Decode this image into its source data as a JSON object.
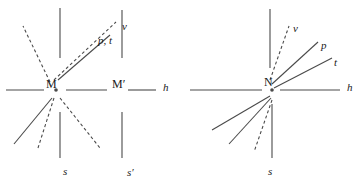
{
  "figure": {
    "stroke_color": "#4a4a4a",
    "text_color": "#1a1a1a",
    "background_color": "#ffffff"
  },
  "panels": [
    {
      "id": "left",
      "center_label": "M",
      "secondary_center_label": "M′",
      "labels": {
        "horizontal_axis": "h",
        "vertical_upper": "v",
        "upper_right_ray": "p, t",
        "vertical_lower": "s",
        "vertical_lower_secondary": "s′"
      },
      "label_positions": [
        {
          "name": "label-v",
          "text": "v",
          "x": 122,
          "y": 21,
          "style": "italic"
        },
        {
          "name": "label-p-t",
          "text": "p, t",
          "x": 98,
          "y": 35,
          "style": "italic"
        },
        {
          "name": "label-h",
          "text": "h",
          "x": 163,
          "y": 82,
          "style": "italic"
        },
        {
          "name": "label-M",
          "text": "M",
          "x": 46,
          "y": 78,
          "style": "roman"
        },
        {
          "name": "label-M-prime",
          "text": "M′",
          "x": 112,
          "y": 78,
          "style": "roman"
        },
        {
          "name": "label-s",
          "text": "s",
          "x": 63,
          "y": 166,
          "style": "italic"
        },
        {
          "name": "label-s-prime",
          "text": "s′",
          "x": 127,
          "y": 167,
          "style": "italic"
        }
      ],
      "geometry": {
        "center": {
          "x": 56,
          "y": 90
        },
        "dot_radius": 1.8,
        "horizontal_segments": [
          {
            "x1": 6,
            "y1": 90,
            "x2": 44,
            "y2": 90
          },
          {
            "x1": 66,
            "y1": 90,
            "x2": 107,
            "y2": 90
          },
          {
            "x1": 128,
            "y1": 90,
            "x2": 156,
            "y2": 90
          }
        ],
        "vertical_segments": [
          {
            "name": "v-upper-left",
            "x1": 60,
            "y1": 8,
            "x2": 60,
            "y2": 58,
            "dash": "none"
          },
          {
            "name": "v-upper-right",
            "x1": 122,
            "y1": 10,
            "x2": 122,
            "y2": 58,
            "dash": "none"
          },
          {
            "name": "s-lower-left",
            "x1": 60,
            "y1": 112,
            "x2": 60,
            "y2": 158,
            "dash": "none"
          },
          {
            "name": "s-lower-right",
            "x1": 122,
            "y1": 112,
            "x2": 122,
            "y2": 158,
            "dash": "none"
          }
        ],
        "rays": [
          {
            "name": "ray-upper-left-dashed",
            "x1": 50,
            "y1": 82,
            "x2": 23,
            "y2": 26,
            "dash": "3,2.5"
          },
          {
            "name": "ray-v-dashed",
            "x1": 54,
            "y1": 80,
            "x2": 116,
            "y2": 22,
            "dash": "3,2.5"
          },
          {
            "name": "ray-p-t-solid",
            "x1": 58,
            "y1": 80,
            "x2": 110,
            "y2": 35,
            "dash": "none"
          },
          {
            "name": "ray-lower-left-solid",
            "x1": 52,
            "y1": 98,
            "x2": 14,
            "y2": 144,
            "dash": "none"
          },
          {
            "name": "ray-lower-left-dashed",
            "x1": 54,
            "y1": 98,
            "x2": 38,
            "y2": 148,
            "dash": "3,2.5"
          },
          {
            "name": "ray-lower-right-dashed",
            "x1": 60,
            "y1": 98,
            "x2": 100,
            "y2": 148,
            "dash": "3,2.5"
          }
        ]
      }
    },
    {
      "id": "right",
      "center_label": "N",
      "labels": {
        "horizontal_axis": "h",
        "vertical_upper": "v",
        "ray_p": "p",
        "ray_t": "t",
        "vertical_lower": "s"
      },
      "label_positions": [
        {
          "name": "label-v",
          "text": "v",
          "x": 111,
          "y": 23,
          "style": "italic"
        },
        {
          "name": "label-p",
          "text": "p",
          "x": 139,
          "y": 40,
          "style": "italic"
        },
        {
          "name": "label-t",
          "text": "t",
          "x": 152,
          "y": 57,
          "style": "italic"
        },
        {
          "name": "label-h",
          "text": "h",
          "x": 165,
          "y": 82,
          "style": "italic"
        },
        {
          "name": "label-N",
          "text": "N",
          "x": 82,
          "y": 76,
          "style": "roman"
        },
        {
          "name": "label-s",
          "text": "s",
          "x": 86,
          "y": 166,
          "style": "italic"
        }
      ],
      "geometry": {
        "center": {
          "x": 90,
          "y": 90
        },
        "dot_radius": 1.8,
        "horizontal_segments": [
          {
            "x1": 8,
            "y1": 90,
            "x2": 80,
            "y2": 90
          },
          {
            "x1": 98,
            "y1": 90,
            "x2": 158,
            "y2": 90
          }
        ],
        "vertical_segments": [
          {
            "name": "v-upper",
            "x1": 88,
            "y1": 9,
            "x2": 88,
            "y2": 68,
            "dash": "none"
          },
          {
            "name": "s-lower",
            "x1": 90,
            "y1": 104,
            "x2": 90,
            "y2": 158,
            "dash": "none"
          }
        ],
        "rays": [
          {
            "name": "ray-v-dashed",
            "x1": 88,
            "y1": 80,
            "x2": 107,
            "y2": 26,
            "dash": "3,2.5"
          },
          {
            "name": "ray-p-solid",
            "x1": 90,
            "y1": 84,
            "x2": 136,
            "y2": 42,
            "dash": "none"
          },
          {
            "name": "ray-t-solid",
            "x1": 92,
            "y1": 88,
            "x2": 150,
            "y2": 58,
            "dash": "none"
          },
          {
            "name": "ray-lower-left-1-solid",
            "x1": 88,
            "y1": 96,
            "x2": 30,
            "y2": 130,
            "dash": "none"
          },
          {
            "name": "ray-lower-left-2-solid",
            "x1": 89,
            "y1": 98,
            "x2": 47,
            "y2": 144,
            "dash": "none"
          },
          {
            "name": "ray-lower-dashed",
            "x1": 90,
            "y1": 100,
            "x2": 72,
            "y2": 152,
            "dash": "3,2.5"
          }
        ]
      }
    }
  ]
}
